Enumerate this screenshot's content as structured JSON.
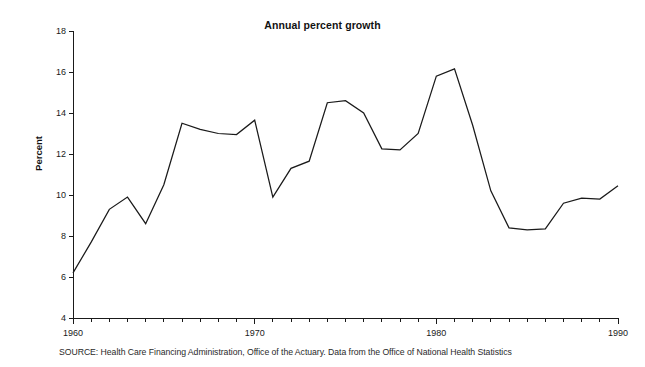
{
  "figure": {
    "title": "Annual percent growth",
    "ylabel": "Percent",
    "source_note": "SOURCE: Health Care Financing Administration, Office of the Actuary. Data from the Office of National Health Statistics"
  },
  "chart_data": {
    "type": "line",
    "title": "Annual percent growth",
    "xlabel": "",
    "ylabel": "Percent",
    "xlim": [
      1960,
      1990
    ],
    "ylim": [
      4,
      18
    ],
    "grid": false,
    "legend": "none",
    "line_color": "#1a1a1a",
    "x_tick_labels": [
      "1960",
      "1970",
      "1980",
      "1990"
    ],
    "x_tick_values": [
      1960,
      1970,
      1980,
      1990
    ],
    "x_minor_ticks_every": 1,
    "y_tick_labels": [
      "4",
      "6",
      "8",
      "10",
      "12",
      "14",
      "16",
      "18"
    ],
    "y_tick_values": [
      4,
      6,
      8,
      10,
      12,
      14,
      16,
      18
    ],
    "x": [
      1960,
      1961,
      1962,
      1963,
      1964,
      1965,
      1966,
      1967,
      1968,
      1969,
      1970,
      1971,
      1972,
      1973,
      1974,
      1975,
      1976,
      1977,
      1978,
      1979,
      1980,
      1981,
      1982,
      1983,
      1984,
      1985,
      1986,
      1987,
      1988,
      1989,
      1990
    ],
    "values": [
      6.2,
      7.7,
      9.3,
      9.9,
      8.6,
      10.5,
      13.5,
      13.2,
      13.0,
      12.95,
      13.65,
      9.9,
      11.3,
      11.65,
      14.5,
      14.6,
      14.0,
      12.25,
      12.2,
      13.0,
      15.8,
      16.15,
      13.4,
      10.2,
      8.4,
      8.3,
      8.35,
      9.6,
      9.85,
      9.8,
      10.45
    ],
    "series": [
      {
        "name": "Annual percent growth",
        "values": [
          6.2,
          7.7,
          9.3,
          9.9,
          8.6,
          10.5,
          13.5,
          13.2,
          13.0,
          12.95,
          13.65,
          9.9,
          11.3,
          11.65,
          14.5,
          14.6,
          14.0,
          12.25,
          12.2,
          13.0,
          15.8,
          16.15,
          13.4,
          10.2,
          8.4,
          8.3,
          8.35,
          9.6,
          9.85,
          9.8,
          10.45
        ]
      }
    ]
  }
}
